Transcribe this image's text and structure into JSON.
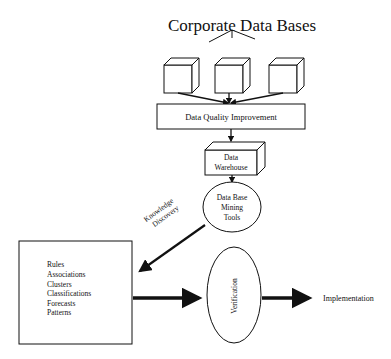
{
  "diagram": {
    "title": "Corporate Data Bases",
    "nodes": {
      "quality": "Data Quality Improvement",
      "warehouse_line1": "Data",
      "warehouse_line2": "Warehouse",
      "mining_line1": "Data Base",
      "mining_line2": "Mining",
      "mining_line3": "Tools",
      "verification": "Verification",
      "implementation": "Implementation"
    },
    "edge_labels": {
      "discovery_line1": "Knowledge",
      "discovery_line2": "Discovery"
    },
    "results": [
      "Rules",
      "Associations",
      "Clusters",
      "Classifications",
      "Forecasts",
      "Patterns"
    ],
    "colors": {
      "ink": "#111111",
      "background": "#ffffff"
    }
  }
}
